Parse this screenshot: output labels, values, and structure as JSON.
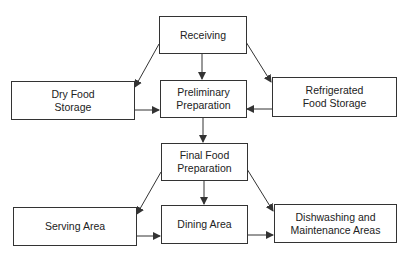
{
  "diagram": {
    "type": "flowchart",
    "title": "",
    "nodes": [
      {
        "id": "receiving",
        "lines": [
          "Receiving"
        ]
      },
      {
        "id": "dry",
        "lines": [
          "Dry Food",
          "Storage"
        ]
      },
      {
        "id": "prelim",
        "lines": [
          "Preliminary",
          "Preparation"
        ]
      },
      {
        "id": "refrig",
        "lines": [
          "Refrigerated",
          "Food Storage"
        ]
      },
      {
        "id": "final",
        "lines": [
          "Final Food",
          "Preparation"
        ]
      },
      {
        "id": "serving",
        "lines": [
          "Serving Area"
        ]
      },
      {
        "id": "dining",
        "lines": [
          "Dining Area"
        ]
      },
      {
        "id": "dish",
        "lines": [
          "Dishwashing and",
          "Maintenance Areas"
        ]
      }
    ],
    "edges": [
      {
        "from": "receiving",
        "to": "dry"
      },
      {
        "from": "receiving",
        "to": "prelim"
      },
      {
        "from": "receiving",
        "to": "refrig"
      },
      {
        "from": "dry",
        "to": "prelim"
      },
      {
        "from": "refrig",
        "to": "prelim"
      },
      {
        "from": "prelim",
        "to": "final"
      },
      {
        "from": "final",
        "to": "serving"
      },
      {
        "from": "final",
        "to": "dining"
      },
      {
        "from": "final",
        "to": "dish"
      },
      {
        "from": "serving",
        "to": "dining"
      },
      {
        "from": "dining",
        "to": "dish"
      }
    ],
    "colors": {
      "line": "#333333",
      "text": "#222222",
      "background": "#ffffff"
    }
  }
}
